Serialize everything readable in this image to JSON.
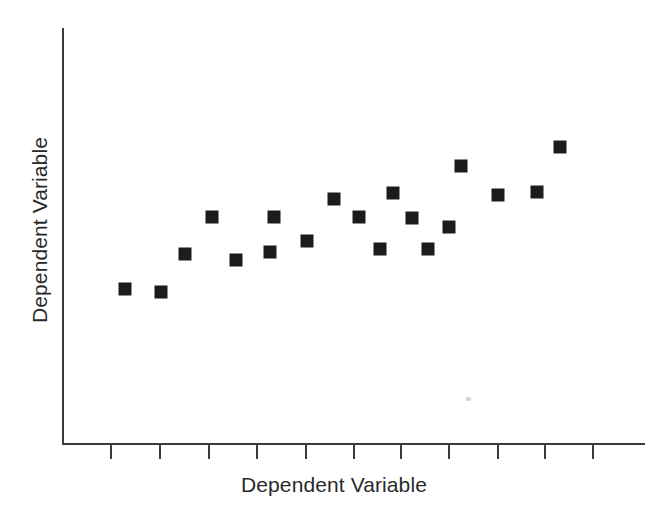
{
  "chart_data": {
    "type": "scatter",
    "title": "",
    "subtitle": "",
    "xlabel": "Dependent Variable",
    "ylabel": "Dependent Variable",
    "grid": false,
    "legend": false,
    "legend_position": "none",
    "marker": {
      "shape": "square",
      "color": "#1c1c1c",
      "size_px": 13,
      "count": 19
    },
    "axes": {
      "x_axis_color": "#3b3b3b",
      "y_axis_color": "#3b3b3b",
      "x_tick_count": 11,
      "y_tick_count": 0,
      "x_tick_labels": [],
      "y_tick_labels": [],
      "xlim": [
        0,
        1
      ],
      "ylim": [
        0,
        1
      ],
      "x_axis_pixels": {
        "left": 62,
        "right": 645,
        "y": 443
      },
      "y_axis_pixels": {
        "x": 62,
        "top": 28,
        "bottom": 445
      }
    },
    "x_tick_positions_px": [
      110,
      159,
      208,
      256,
      305,
      353,
      400,
      448,
      497,
      544,
      592
    ],
    "points_px": [
      {
        "x": 125,
        "y": 289
      },
      {
        "x": 161,
        "y": 292
      },
      {
        "x": 185,
        "y": 254
      },
      {
        "x": 212,
        "y": 217
      },
      {
        "x": 236,
        "y": 260
      },
      {
        "x": 270,
        "y": 252
      },
      {
        "x": 274,
        "y": 217
      },
      {
        "x": 307,
        "y": 241
      },
      {
        "x": 334,
        "y": 199
      },
      {
        "x": 359,
        "y": 217
      },
      {
        "x": 380,
        "y": 249
      },
      {
        "x": 393,
        "y": 193
      },
      {
        "x": 412,
        "y": 218
      },
      {
        "x": 428,
        "y": 249
      },
      {
        "x": 449,
        "y": 227
      },
      {
        "x": 461,
        "y": 166
      },
      {
        "x": 498,
        "y": 195
      },
      {
        "x": 537,
        "y": 192
      },
      {
        "x": 560,
        "y": 147
      }
    ],
    "points_data": [
      {
        "x": 0.08,
        "y": 0.37
      },
      {
        "x": 0.17,
        "y": 0.36
      },
      {
        "x": 0.21,
        "y": 0.45
      },
      {
        "x": 0.26,
        "y": 0.54
      },
      {
        "x": 0.3,
        "y": 0.44
      },
      {
        "x": 0.36,
        "y": 0.46
      },
      {
        "x": 0.36,
        "y": 0.54
      },
      {
        "x": 0.42,
        "y": 0.49
      },
      {
        "x": 0.47,
        "y": 0.59
      },
      {
        "x": 0.51,
        "y": 0.54
      },
      {
        "x": 0.55,
        "y": 0.47
      },
      {
        "x": 0.57,
        "y": 0.6
      },
      {
        "x": 0.6,
        "y": 0.54
      },
      {
        "x": 0.63,
        "y": 0.47
      },
      {
        "x": 0.66,
        "y": 0.52
      },
      {
        "x": 0.68,
        "y": 0.67
      },
      {
        "x": 0.75,
        "y": 0.6
      },
      {
        "x": 0.81,
        "y": 0.6
      },
      {
        "x": 0.85,
        "y": 0.71
      }
    ],
    "annotations": []
  },
  "figure": {
    "background_color": "#ffffff",
    "axis_color": "#3b3b3b",
    "text_color": "#2a2a2a",
    "marker_color": "#1c1c1c"
  }
}
